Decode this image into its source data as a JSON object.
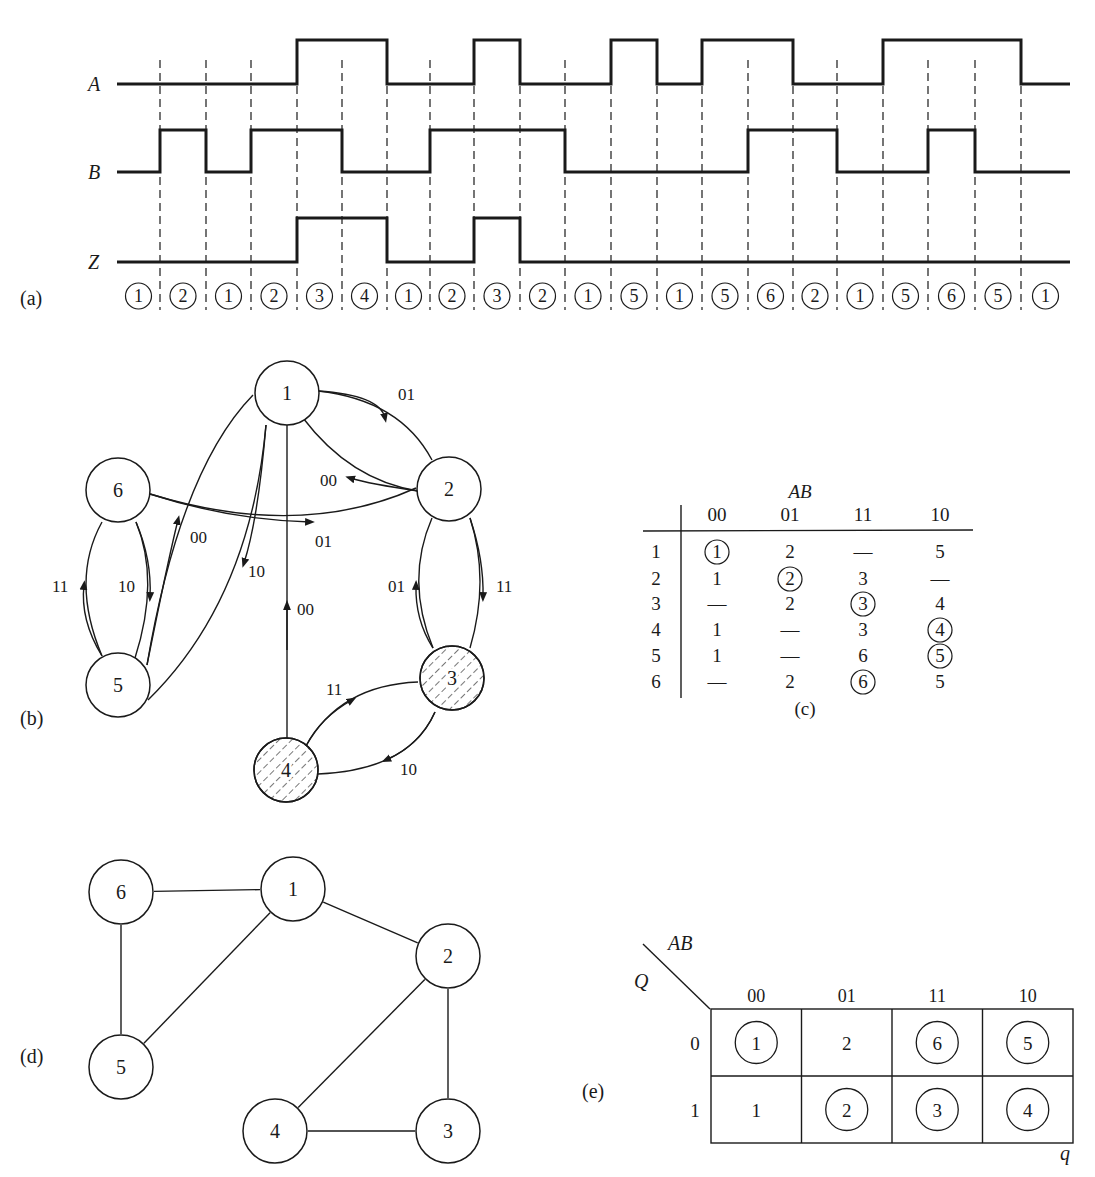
{
  "panel_labels": {
    "a": "(a)",
    "b": "(b)",
    "c": "(c)",
    "d": "(d)",
    "e": "(e)"
  },
  "timing": {
    "signals": [
      {
        "name": "A",
        "values": [
          0,
          0,
          0,
          0,
          1,
          1,
          0,
          0,
          1,
          0,
          0,
          1,
          0,
          1,
          1,
          0,
          0,
          1,
          1,
          1,
          0
        ]
      },
      {
        "name": "B",
        "values": [
          0,
          1,
          0,
          1,
          1,
          0,
          0,
          1,
          1,
          1,
          0,
          0,
          0,
          0,
          1,
          1,
          0,
          0,
          1,
          0,
          0
        ]
      },
      {
        "name": "Z",
        "values": [
          0,
          0,
          0,
          0,
          1,
          1,
          0,
          0,
          1,
          0,
          0,
          0,
          0,
          0,
          0,
          0,
          0,
          0,
          0,
          0,
          0
        ]
      }
    ],
    "states": [
      "1",
      "2",
      "1",
      "2",
      "3",
      "4",
      "1",
      "2",
      "3",
      "2",
      "1",
      "5",
      "1",
      "5",
      "6",
      "2",
      "1",
      "5",
      "6",
      "5",
      "1"
    ]
  },
  "flow_graph": {
    "nodes": [
      {
        "id": "1",
        "label": "1",
        "shaded": false
      },
      {
        "id": "2",
        "label": "2",
        "shaded": false
      },
      {
        "id": "3",
        "label": "3",
        "shaded": true
      },
      {
        "id": "4",
        "label": "4",
        "shaded": true
      },
      {
        "id": "5",
        "label": "5",
        "shaded": false
      },
      {
        "id": "6",
        "label": "6",
        "shaded": false
      }
    ],
    "edges": [
      {
        "from": "1",
        "to": "2",
        "label": "01"
      },
      {
        "from": "2",
        "to": "1",
        "label": "00"
      },
      {
        "from": "6",
        "to": "2",
        "label": "01"
      },
      {
        "from": "5",
        "to": "1",
        "label": "00"
      },
      {
        "from": "1",
        "to": "5",
        "label": "10"
      },
      {
        "from": "4",
        "to": "1",
        "label": "00"
      },
      {
        "from": "5",
        "to": "6",
        "label": "11"
      },
      {
        "from": "6",
        "to": "5",
        "label": "10"
      },
      {
        "from": "3",
        "to": "2",
        "label": "01"
      },
      {
        "from": "2",
        "to": "3",
        "label": "11"
      },
      {
        "from": "4",
        "to": "3",
        "label": "11"
      },
      {
        "from": "3",
        "to": "4",
        "label": "10"
      }
    ]
  },
  "flow_table": {
    "header_var": "AB",
    "columns": [
      "00",
      "01",
      "11",
      "10"
    ],
    "rows": [
      {
        "state": "1",
        "cells": [
          {
            "v": "1",
            "stable": true
          },
          {
            "v": "2",
            "stable": false
          },
          {
            "v": "—",
            "stable": false
          },
          {
            "v": "5",
            "stable": false
          }
        ]
      },
      {
        "state": "2",
        "cells": [
          {
            "v": "1",
            "stable": false
          },
          {
            "v": "2",
            "stable": true
          },
          {
            "v": "3",
            "stable": false
          },
          {
            "v": "—",
            "stable": false
          }
        ]
      },
      {
        "state": "3",
        "cells": [
          {
            "v": "—",
            "stable": false
          },
          {
            "v": "2",
            "stable": false
          },
          {
            "v": "3",
            "stable": true
          },
          {
            "v": "4",
            "stable": false
          }
        ]
      },
      {
        "state": "4",
        "cells": [
          {
            "v": "1",
            "stable": false
          },
          {
            "v": "—",
            "stable": false
          },
          {
            "v": "3",
            "stable": false
          },
          {
            "v": "4",
            "stable": true
          }
        ]
      },
      {
        "state": "5",
        "cells": [
          {
            "v": "1",
            "stable": false
          },
          {
            "v": "—",
            "stable": false
          },
          {
            "v": "6",
            "stable": false
          },
          {
            "v": "5",
            "stable": true
          }
        ]
      },
      {
        "state": "6",
        "cells": [
          {
            "v": "—",
            "stable": false
          },
          {
            "v": "2",
            "stable": false
          },
          {
            "v": "6",
            "stable": true
          },
          {
            "v": "5",
            "stable": false
          }
        ]
      }
    ]
  },
  "merger_graph": {
    "nodes": [
      "1",
      "2",
      "3",
      "4",
      "5",
      "6"
    ],
    "edges": [
      [
        "6",
        "1"
      ],
      [
        "1",
        "2"
      ],
      [
        "6",
        "5"
      ],
      [
        "1",
        "5"
      ],
      [
        "2",
        "4"
      ],
      [
        "2",
        "3"
      ],
      [
        "4",
        "3"
      ]
    ]
  },
  "kmap": {
    "col_var": "AB",
    "row_var": "Q",
    "corner_label": "q",
    "columns": [
      "00",
      "01",
      "11",
      "10"
    ],
    "rows": [
      {
        "label": "0",
        "cells": [
          {
            "v": "1",
            "stable": true
          },
          {
            "v": "2",
            "stable": false
          },
          {
            "v": "6",
            "stable": true
          },
          {
            "v": "5",
            "stable": true
          }
        ]
      },
      {
        "label": "1",
        "cells": [
          {
            "v": "1",
            "stable": false
          },
          {
            "v": "2",
            "stable": true
          },
          {
            "v": "3",
            "stable": true
          },
          {
            "v": "4",
            "stable": true
          }
        ]
      }
    ]
  }
}
